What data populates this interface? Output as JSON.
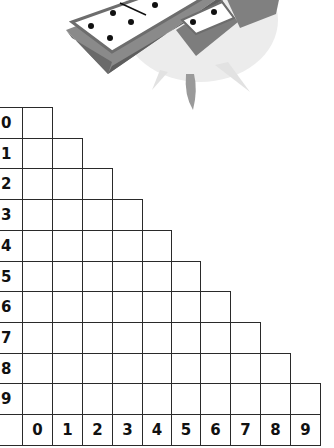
{
  "illustration": {
    "subject": "dominoes",
    "icon": "domino-tiles-illustration",
    "colors": {
      "burst": "#e6e6e6",
      "tile_side": "#7d7d7d",
      "tile_dark": "#5a5a5a",
      "tile_face": "#ffffff",
      "pip": "#111111"
    }
  },
  "grid": {
    "type": "triangular domino table",
    "row_labels": [
      "0",
      "1",
      "2",
      "3",
      "4",
      "5",
      "6",
      "7",
      "8",
      "9"
    ],
    "column_labels": [
      "0",
      "1",
      "2",
      "3",
      "4",
      "5",
      "6",
      "7",
      "8",
      "9"
    ],
    "cells": "empty",
    "colors": {
      "line": "#2a2a2a",
      "text": "#111111",
      "background": "#ffffff"
    }
  }
}
